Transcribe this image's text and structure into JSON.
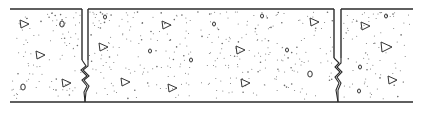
{
  "figure": {
    "caption": "Concrete slab with control joints (sawcut groove with crack below)",
    "width": 421,
    "height": 113,
    "colors": {
      "line": "#2a2a2a",
      "stipple": "#6a6a6a",
      "aggregate": "#333333",
      "background": "#ffffff"
    },
    "slab": {
      "x1": 10,
      "x2": 413,
      "top_y": 9,
      "bottom_y": 102
    },
    "joints": [
      {
        "left_x": 82,
        "right_x": 88,
        "groove_bottom_y": 60,
        "crack": [
          [
            82,
            60
          ],
          [
            86,
            66
          ],
          [
            81,
            70
          ],
          [
            87,
            76
          ],
          [
            82,
            80
          ],
          [
            87,
            86
          ],
          [
            84,
            92
          ],
          [
            85,
            102
          ]
        ]
      },
      {
        "left_x": 334,
        "right_x": 341,
        "groove_bottom_y": 58,
        "crack": [
          [
            334,
            58
          ],
          [
            339,
            63
          ],
          [
            335,
            67
          ],
          [
            340,
            72
          ],
          [
            335,
            77
          ],
          [
            339,
            83
          ],
          [
            336,
            90
          ],
          [
            338,
            102
          ]
        ]
      }
    ],
    "aggregates": [
      {
        "shape": "tri",
        "x": 24,
        "y": 24,
        "r": 4
      },
      {
        "shape": "oval",
        "x": 62,
        "y": 24,
        "r": 3
      },
      {
        "shape": "tri",
        "x": 40,
        "y": 55,
        "r": 4
      },
      {
        "shape": "oval",
        "x": 23,
        "y": 87,
        "r": 3
      },
      {
        "shape": "tri",
        "x": 66,
        "y": 83,
        "r": 4
      },
      {
        "shape": "oval",
        "x": 105,
        "y": 17,
        "r": 2
      },
      {
        "shape": "tri",
        "x": 103,
        "y": 47,
        "r": 4
      },
      {
        "shape": "tri",
        "x": 125,
        "y": 82,
        "r": 4
      },
      {
        "shape": "tri",
        "x": 166,
        "y": 25,
        "r": 4
      },
      {
        "shape": "oval",
        "x": 150,
        "y": 51,
        "r": 2
      },
      {
        "shape": "oval",
        "x": 214,
        "y": 24,
        "r": 2
      },
      {
        "shape": "oval",
        "x": 191,
        "y": 60,
        "r": 2
      },
      {
        "shape": "tri",
        "x": 172,
        "y": 88,
        "r": 4
      },
      {
        "shape": "oval",
        "x": 262,
        "y": 16,
        "r": 2
      },
      {
        "shape": "tri",
        "x": 240,
        "y": 50,
        "r": 4
      },
      {
        "shape": "tri",
        "x": 245,
        "y": 83,
        "r": 4
      },
      {
        "shape": "tri",
        "x": 314,
        "y": 22,
        "r": 4
      },
      {
        "shape": "oval",
        "x": 287,
        "y": 50,
        "r": 2
      },
      {
        "shape": "oval",
        "x": 310,
        "y": 74,
        "r": 3
      },
      {
        "shape": "oval",
        "x": 386,
        "y": 16,
        "r": 2
      },
      {
        "shape": "tri",
        "x": 365,
        "y": 26,
        "r": 4
      },
      {
        "shape": "tri",
        "x": 386,
        "y": 47,
        "r": 5
      },
      {
        "shape": "oval",
        "x": 360,
        "y": 67,
        "r": 2
      },
      {
        "shape": "tri",
        "x": 392,
        "y": 80,
        "r": 4
      },
      {
        "shape": "oval",
        "x": 359,
        "y": 91,
        "r": 2
      }
    ],
    "stipple_count": 520
  }
}
